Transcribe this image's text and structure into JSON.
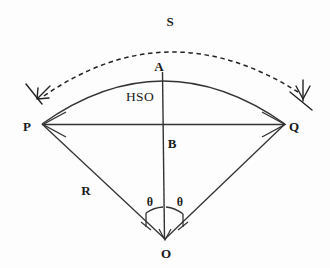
{
  "figure": {
    "type": "geometry-diagram",
    "background_color": "#fdfdfd",
    "stroke_color": "#222222"
  },
  "labels": {
    "arc_length": "S",
    "apex": "A",
    "left_point": "P",
    "right_point": "Q",
    "midpoint": "B",
    "center": "O",
    "radius": "R",
    "sagitta_region": "HSO",
    "theta_left": "θ",
    "theta_right": "θ"
  },
  "geometry": {
    "center_O": [
      165,
      240
    ],
    "point_P": [
      42,
      124
    ],
    "point_Q": [
      285,
      124
    ],
    "point_A": [
      162,
      72
    ],
    "point_B": [
      163,
      125
    ],
    "chord_y": 124,
    "arc_sagitta_apex": [
      162,
      72
    ],
    "outer_dashed_arc_apex": [
      167,
      38
    ],
    "radius_length_px": 169,
    "half_angle_deg": 23
  },
  "elements": {
    "solid_arc": "arc from P through A to Q",
    "dashed_arc": "outer dashed arc with arrowheads at both ends indicating S",
    "chord": "double-headed arrow segment from P to Q",
    "vertical": "segment from A through B to O",
    "radii": [
      "O to P",
      "O to Q"
    ],
    "angle_arcs": [
      "theta left of vertical",
      "theta right of vertical"
    ]
  }
}
